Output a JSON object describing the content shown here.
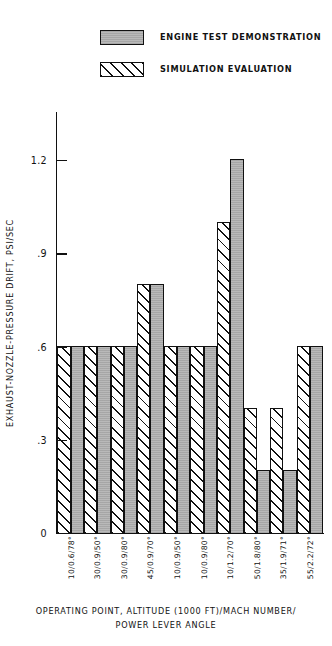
{
  "chart_data": {
    "type": "bar",
    "title": "",
    "xlabel": "OPERATING POINT, ALTITUDE (1000 FT)/MACH NUMBER/ POWER LEVER ANGLE",
    "ylabel": "EXHAUST-NOZZLE-PRESSURE DRIFT, PSI/SEC",
    "ylim": [
      0,
      1.35
    ],
    "yticks": [
      0,
      0.3,
      0.6,
      0.9,
      1.2
    ],
    "ytick_labels": [
      "0",
      ".3",
      ".6",
      ".9",
      "1.2"
    ],
    "grid": false,
    "legend_position": "top-center",
    "categories": [
      "10/0.6/78°",
      "30/0.9/50°",
      "30/0.9/80°",
      "45/0.9/70°",
      "10/0.9/50°",
      "10/0.9/80°",
      "10/1.2/70°",
      "50/1.8/80°",
      "35/1.9/71°",
      "55/2.2/72°"
    ],
    "series": [
      {
        "name": "SIMULATION EVALUATION",
        "style": "hatched",
        "values": [
          0.6,
          0.6,
          0.6,
          0.8,
          0.6,
          0.6,
          1.0,
          0.4,
          0.4,
          0.6
        ]
      },
      {
        "name": "ENGINE TEST DEMONSTRATION",
        "style": "solid-gray",
        "values": [
          0.6,
          0.6,
          0.6,
          0.8,
          0.6,
          0.6,
          1.2,
          0.2,
          0.2,
          0.6
        ]
      }
    ]
  },
  "legend": {
    "items": [
      {
        "label": "ENGINE TEST DEMONSTRATION",
        "swatch": "solid-gray-swatch"
      },
      {
        "label": "SIMULATION EVALUATION",
        "swatch": "hatched-swatch"
      }
    ]
  },
  "axis": {
    "y_title": "EXHAUST-NOZZLE-PRESSURE DRIFT, PSI/SEC",
    "y_tick_labels": [
      "1.2",
      ".9",
      ".6",
      ".3",
      "0"
    ]
  },
  "caption": {
    "line1": "OPERATING POINT, ALTITUDE (1000 FT)/MACH NUMBER/",
    "line2": "POWER LEVER ANGLE"
  }
}
